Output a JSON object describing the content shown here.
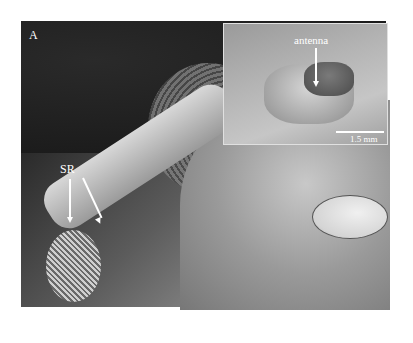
{
  "figure": {
    "panel_label": "A",
    "main_image": {
      "description": "SEM micrograph of insect antenna with clubbed tip and compound eye",
      "annotation_label": "SR",
      "scale_bar_label": "300 µm"
    },
    "inset_image": {
      "description": "SEM overview of insect ventral view",
      "annotation_label": "antenna",
      "scale_bar_label": "1.5 mm"
    }
  }
}
